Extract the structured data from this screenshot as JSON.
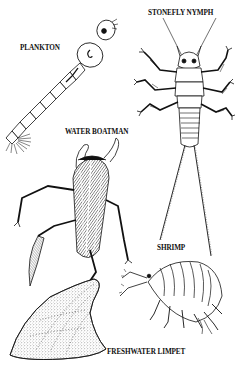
{
  "figure": {
    "background_color": "#ffffff",
    "ink_color": "#111111",
    "labels": [
      {
        "id": "plankton",
        "text": "PLANKTON"
      },
      {
        "id": "stonefly",
        "text": "STONEFLY NYMPH"
      },
      {
        "id": "boatman",
        "text": "WATER BOATMAN"
      },
      {
        "id": "shrimp",
        "text": "SHRIMP"
      },
      {
        "id": "limpet",
        "text": "FRESHWATER LIMPET"
      }
    ],
    "specimens": [
      {
        "name": "plankton-larva"
      },
      {
        "name": "stonefly-nymph"
      },
      {
        "name": "water-boatman"
      },
      {
        "name": "freshwater-shrimp"
      },
      {
        "name": "freshwater-limpet"
      }
    ]
  }
}
